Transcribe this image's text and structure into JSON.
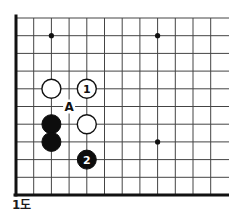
{
  "figure": {
    "caption": "1도",
    "kind": "go-board-diagram"
  },
  "board": {
    "cols": 12,
    "rows": 11,
    "origin_x": 16,
    "origin_y": 18,
    "spacing": 17.7,
    "line_color": "#444444",
    "edge_color": "#111111",
    "edge_width": 3,
    "line_width": 1,
    "background": "#ffffff",
    "edges": [
      "left",
      "bottom"
    ],
    "star_points": [
      {
        "col": 3,
        "row": 2
      },
      {
        "col": 9,
        "row": 2
      },
      {
        "col": 9,
        "row": 8
      }
    ],
    "star_radius": 2.6,
    "star_color": "#111111"
  },
  "stones": [
    {
      "id": "w-a",
      "color": "white",
      "col": 3,
      "row": 5,
      "label": ""
    },
    {
      "id": "w-1",
      "color": "white",
      "col": 5,
      "row": 5,
      "label": "1"
    },
    {
      "id": "b-a",
      "color": "black",
      "col": 3,
      "row": 7,
      "label": ""
    },
    {
      "id": "w-b",
      "color": "white",
      "col": 5,
      "row": 7,
      "label": ""
    },
    {
      "id": "b-b",
      "color": "black",
      "col": 3,
      "row": 8,
      "label": ""
    },
    {
      "id": "b-2",
      "color": "black",
      "col": 5,
      "row": 9,
      "label": "2"
    }
  ],
  "stone_style": {
    "radius": 9.5,
    "white_fill": "#ffffff",
    "white_stroke": "#111111",
    "white_stroke_width": 1.4,
    "black_fill": "#0d0d0d",
    "black_stroke": "#0d0d0d",
    "black_label_color": "#ffffff",
    "white_label_color": "#111111",
    "label_font_size": 11
  },
  "markers": [
    {
      "id": "point-a",
      "text": "A",
      "col": 4,
      "row": 6,
      "color": "#111111",
      "font_size": 12
    }
  ]
}
